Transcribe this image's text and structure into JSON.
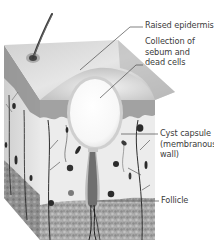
{
  "diagram": {
    "labels": [
      {
        "id": "raised-epidermis",
        "text": "Raised epidermis"
      },
      {
        "id": "collection",
        "text": "Collection of\nsebum and\ndead cells"
      },
      {
        "id": "cyst-capsule",
        "text": "Cyst capsule\n(membranous\nwall)"
      },
      {
        "id": "follicle",
        "text": "Follicle"
      }
    ],
    "colors": {
      "background": "#ffffff",
      "skin_top": "#d9d9d9",
      "dermis": "#ececec",
      "epidermis_band": "#8c8c8c",
      "fat_layer": "#9a9a9a",
      "cyst_fill": "#fbfbfb",
      "cyst_wall": "#c8c8c8",
      "follicle": "#6e6e6e",
      "leader_line": "#4a4a4a",
      "label_text": "#3c3c3c"
    }
  }
}
